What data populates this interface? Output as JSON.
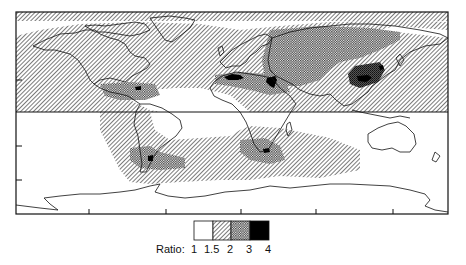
{
  "figure": {
    "type": "world-map",
    "projection": "equirectangular",
    "frame": {
      "x": 16,
      "y": 12,
      "width": 432,
      "height": 202
    },
    "equator_y": 112,
    "x_ticks_px": [
      89,
      166,
      241,
      316,
      393
    ],
    "y_ticks_px": [
      80,
      145,
      180
    ],
    "colors": {
      "frame": "#111111",
      "coast": "#111111",
      "background": "#ffffff",
      "hatch": "#222222",
      "solid": "#000000"
    }
  },
  "legend": {
    "title": "Ratio:",
    "levels": [
      {
        "label": "1",
        "pattern": "white"
      },
      {
        "label": "1.5",
        "pattern": "diagonal-hatch"
      },
      {
        "label": "2",
        "pattern": "cross-hatch"
      },
      {
        "label": "3",
        "pattern": "dense-dots"
      },
      {
        "label": "4",
        "pattern": "solid-black"
      }
    ],
    "bin_edges": [
      "1",
      "1.5",
      "2",
      "3",
      "4"
    ]
  },
  "regions": [
    {
      "name": "north-pacific-atlantic-band",
      "level": "1.5"
    },
    {
      "name": "central-america",
      "level": "2-3"
    },
    {
      "name": "north-africa-sahara-edge",
      "level": "3-4"
    },
    {
      "name": "middle-east",
      "level": "3-4"
    },
    {
      "name": "central-asia",
      "level": "2"
    },
    {
      "name": "east-asia-china",
      "level": "3-4"
    },
    {
      "name": "south-america-south",
      "level": "3-4"
    },
    {
      "name": "southern-africa",
      "level": "3-4"
    },
    {
      "name": "southern-ocean-band",
      "level": "1.5"
    }
  ]
}
